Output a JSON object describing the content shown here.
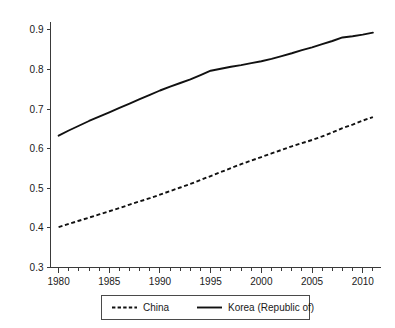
{
  "chart_data": {
    "type": "line",
    "title": "",
    "subtitle": "",
    "xlabel": "",
    "ylabel": "",
    "xlim": [
      1979.2,
      2011.8
    ],
    "ylim": [
      0.3,
      0.92
    ],
    "grid": false,
    "legend_position": "bottom-center",
    "x_tick_labels": [
      "1980",
      "1985",
      "1990",
      "1995",
      "2000",
      "2005",
      "2010"
    ],
    "x_tick_values": [
      1980,
      1985,
      1990,
      1995,
      2000,
      2005,
      2010
    ],
    "x_minor_tick_step": 1,
    "y_tick_labels": [
      "0.3",
      "0.4",
      "0.5",
      "0.6",
      "0.7",
      "0.8",
      "0.9"
    ],
    "y_tick_values": [
      0.3,
      0.4,
      0.5,
      0.6,
      0.7,
      0.8,
      0.9
    ],
    "x": [
      1980,
      1981,
      1982,
      1983,
      1984,
      1985,
      1986,
      1987,
      1988,
      1989,
      1990,
      1991,
      1992,
      1993,
      1994,
      1995,
      1996,
      1997,
      1998,
      1999,
      2000,
      2001,
      2002,
      2003,
      2004,
      2005,
      2006,
      2007,
      2008,
      2009,
      2010,
      2011
    ],
    "series": [
      {
        "name": "China",
        "style": "dashed",
        "color": "#111111",
        "values": [
          0.402,
          0.41,
          0.418,
          0.426,
          0.434,
          0.442,
          0.45,
          0.459,
          0.467,
          0.475,
          0.484,
          0.493,
          0.502,
          0.511,
          0.521,
          0.531,
          0.541,
          0.551,
          0.561,
          0.57,
          0.579,
          0.588,
          0.597,
          0.606,
          0.614,
          0.622,
          0.631,
          0.641,
          0.652,
          0.661,
          0.671,
          0.68
        ]
      },
      {
        "name": "Korea (Republic of)",
        "style": "solid",
        "color": "#111111",
        "values": [
          0.633,
          0.646,
          0.658,
          0.67,
          0.681,
          0.692,
          0.703,
          0.714,
          0.725,
          0.736,
          0.747,
          0.757,
          0.766,
          0.775,
          0.786,
          0.797,
          0.802,
          0.807,
          0.811,
          0.816,
          0.821,
          0.827,
          0.834,
          0.841,
          0.849,
          0.856,
          0.864,
          0.872,
          0.881,
          0.884,
          0.888,
          0.893
        ]
      }
    ]
  },
  "legend": {
    "entries": [
      {
        "label": "China",
        "style": "dashed"
      },
      {
        "label": "Korea (Republic of)",
        "style": "solid"
      }
    ]
  },
  "axes": {
    "y_ticks": [
      {
        "label": "0.9"
      },
      {
        "label": "0.8"
      },
      {
        "label": "0.7"
      },
      {
        "label": "0.6"
      },
      {
        "label": "0.5"
      },
      {
        "label": "0.4"
      },
      {
        "label": "0.3"
      }
    ],
    "x_ticks": [
      {
        "label": "1980"
      },
      {
        "label": "1985"
      },
      {
        "label": "1990"
      },
      {
        "label": "1995"
      },
      {
        "label": "2000"
      },
      {
        "label": "2005"
      },
      {
        "label": "2010"
      }
    ]
  }
}
